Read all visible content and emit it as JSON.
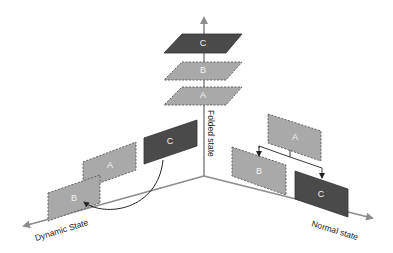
{
  "colors": {
    "background": "#ffffff",
    "axis": "#8c8c8c",
    "layer_light": "#a9a9a9",
    "layer_dark": "#4a4a4a",
    "layer_border_dashed": "#555555",
    "layer_label": "#efefef",
    "text": "#222222",
    "arrow": "#222222"
  },
  "axes": {
    "vertical": {
      "label": "Folded state"
    },
    "left": {
      "label": "Dynamic State"
    },
    "right": {
      "label": "Normal state"
    }
  },
  "folded_stack": {
    "layers": [
      {
        "label": "C",
        "style": "dark"
      },
      {
        "label": "B",
        "style": "light-dashed"
      },
      {
        "label": "A",
        "style": "light-dashed"
      }
    ]
  },
  "dynamic_group": {
    "layers": [
      {
        "label": "A",
        "style": "light-dashed"
      },
      {
        "label": "B",
        "style": "light-dashed"
      },
      {
        "label": "C",
        "style": "dark"
      }
    ],
    "arrow": {
      "from": "C",
      "to": "B",
      "shape": "curved"
    }
  },
  "normal_group": {
    "layers": [
      {
        "label": "A",
        "style": "light-dashed"
      },
      {
        "label": "B",
        "style": "light-dashed"
      },
      {
        "label": "C",
        "style": "dark"
      }
    ],
    "connector": {
      "from": "A",
      "to": [
        "B",
        "C"
      ],
      "shape": "bracket"
    }
  }
}
